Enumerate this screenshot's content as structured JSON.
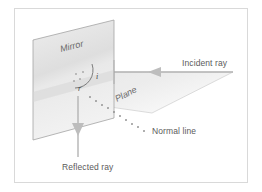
{
  "figure": {
    "kind": "physics-diagram",
    "background_color": "#ffffff",
    "frame": {
      "border_color": "#d9d9d9",
      "x": 14,
      "y": 8,
      "width": 234,
      "height": 175
    }
  },
  "labels": {
    "mirror": "Mirror",
    "plane": "Plane",
    "incident_ray": "Incident ray",
    "reflected_ray": "Reflected ray",
    "normal_line": "Normal line",
    "angle_incidence": "i",
    "angle_reflection": "r"
  },
  "colors": {
    "mirror_fill": "#e4e4e4",
    "mirror_stroke": "#9a9a9a",
    "plane_fill": "#ebebeb",
    "plane_stroke": "#c2c2c2",
    "ray_stroke": "#b0b0b0",
    "arrow_fill": "#bdbdbd",
    "normal_dot": "#8a8a8a",
    "arc_stroke": "#6f6f6f",
    "text": "#5b5b5b"
  },
  "geometry": {
    "mirror_polygon": "33,40 114,20 114,118 33,140",
    "plane_polygon": "33,96 114,72 233,72 152,113",
    "incident_ray": {
      "x1": 233,
      "y1": 72,
      "x2": 114,
      "y2": 72
    },
    "reflected_ray": {
      "x1": 78,
      "y1": 96,
      "x2": 78,
      "y2": 156
    },
    "normal_line_start": {
      "x": 88,
      "y": 96
    },
    "normal_line_end": {
      "x": 146,
      "y": 131
    }
  }
}
